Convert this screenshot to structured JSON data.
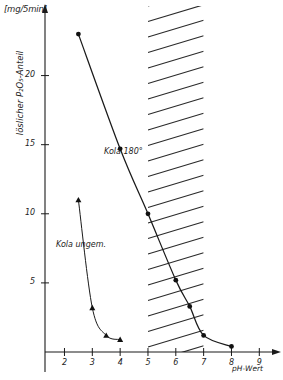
{
  "chart_data": {
    "type": "line",
    "title": "",
    "xlabel": "pH-Wert",
    "ylabel": "löslicher P₂O₅-Anteil",
    "yunit": "[mg/5min]",
    "xlim": [
      1.3,
      9.6
    ],
    "ylim": [
      0,
      24.6
    ],
    "xticks": [
      2,
      3,
      4,
      5,
      6,
      7,
      8,
      9
    ],
    "yticks": [
      5,
      10,
      15,
      20
    ],
    "grid": false,
    "legend": "inline-annotations",
    "series": [
      {
        "name": "Kola 180°",
        "marker": "filled-circle",
        "points": [
          {
            "x": 2.5,
            "y": 23.0
          },
          {
            "x": 4.0,
            "y": 14.7
          },
          {
            "x": 5.0,
            "y": 10.0
          },
          {
            "x": 6.0,
            "y": 5.2
          },
          {
            "x": 6.5,
            "y": 3.3
          },
          {
            "x": 7.0,
            "y": 1.2
          },
          {
            "x": 8.0,
            "y": 0.4
          }
        ]
      },
      {
        "name": "Kola ungem.",
        "marker": "filled-triangle",
        "points": [
          {
            "x": 2.5,
            "y": 11.0
          },
          {
            "x": 3.0,
            "y": 3.2
          },
          {
            "x": 3.5,
            "y": 1.2
          },
          {
            "x": 4.0,
            "y": 0.9
          }
        ]
      }
    ],
    "shaded_band": {
      "label": "hatched-region",
      "x_from": 5.0,
      "x_to": 7.0,
      "pattern": "diagonal-hatch"
    },
    "annotations": [
      {
        "name": "series-a-label",
        "text": "Kola 180°"
      },
      {
        "name": "series-b-label",
        "text": "Kola ungem."
      }
    ]
  },
  "axes": {
    "unit_label": "[mg/5min]",
    "y_title": "löslicher P₂O₅-Anteil",
    "x_title": "pH-Wert",
    "y_tick_labels": [
      "5",
      "10",
      "15",
      "20"
    ],
    "x_tick_labels": [
      "2",
      "3",
      "4",
      "5",
      "6",
      "7",
      "8",
      "9"
    ]
  },
  "colors": {
    "ink": "#1a1a1a",
    "background": "#ffffff",
    "hatch": "#2b2b2b"
  }
}
